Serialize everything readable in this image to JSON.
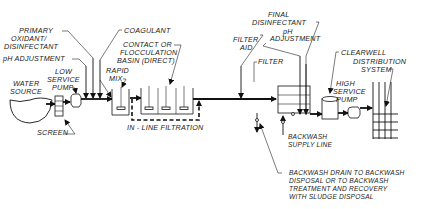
{
  "diagram": {
    "labels": {
      "primary_oxidant_1": "PRIMARY",
      "primary_oxidant_2": "OXIDANT/",
      "primary_oxidant_3": "DISINFECTANT",
      "ph_adjustment_1": "pH ADJUSTMENT",
      "low_service_pump_1": "LOW",
      "low_service_pump_2": "SERVICE",
      "low_service_pump_3": "PUMP",
      "water_source_1": "WATER",
      "water_source_2": "SOURCE",
      "screen": "SCREEN",
      "coagulant": "COAGULANT",
      "rapid_mix_1": "RAPID",
      "rapid_mix_2": "MIX",
      "contact_basin_1": "CONTACT  OR",
      "contact_basin_2": "FLOCCULATION",
      "contact_basin_3": "BASIN (DIRECT)",
      "in_line_filtration": "IN - LINE FILTRATION",
      "filter_aid_1": "FILTER",
      "filter_aid_2": "AID",
      "final_disinfectant_1": "FINAL",
      "final_disinfectant_2": "DISINFECTANT",
      "ph_adjustment_2a": "pH",
      "ph_adjustment_2b": "ADJUSTMENT",
      "filter": "FILTER",
      "clearwell": "CLEARWELL",
      "high_service_pump_1": "HIGH",
      "high_service_pump_2": "SERVICE",
      "high_service_pump_3": "PUMP",
      "distribution_1": "DISTRIBUTION",
      "distribution_2": "SYSTEM",
      "backwash_supply_1": "BACKWASH",
      "backwash_supply_2": "SUPPLY LINE",
      "backwash_drain_1": "BACKWASH DRAIN TO BACKWASH",
      "backwash_drain_2": "DISPOSAL OR TO BACKWASH",
      "backwash_drain_3": "TREATMENT AND RECOVERY",
      "backwash_drain_4": "WITH SLUDGE DISPOSAL"
    }
  }
}
